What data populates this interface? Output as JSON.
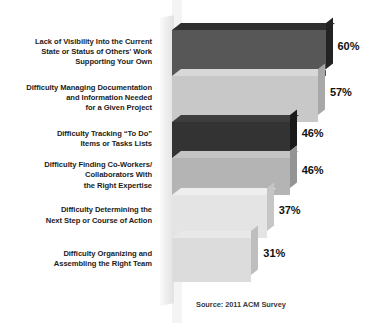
{
  "chart_data": {
    "type": "bar",
    "orientation": "horizontal",
    "title": "",
    "subtitle": "",
    "xlabel": "",
    "ylabel": "",
    "xlim": [
      0,
      60
    ],
    "grid": false,
    "legend": "none",
    "value_suffix": "%",
    "source": "Source: 2011 ACM Survey",
    "categories": [
      "Lack of Visibility Into the Current State or Status of Others' Work Supporting Your Own",
      "Difficulty Managing Documentation and Information Needed for a Given Project",
      "Difficulty Tracking “To Do” Items or Tasks Lists",
      "Difficulty Finding Co-Workers/ Collaborators With the Right Expertise",
      "Difficulty Determining the Next Step or Course of Action",
      "Difficulty Organizing and Assembling the Right Team"
    ],
    "values": [
      60,
      57,
      46,
      46,
      37,
      31
    ],
    "value_labels": [
      "60%",
      "57%",
      "46%",
      "46%",
      "37%",
      "31%"
    ],
    "bar_colors": [
      "#575757",
      "#c8c8c8",
      "#333333",
      "#b4b4b4",
      "#e4e4e4",
      "#dcdcdc"
    ],
    "bars": [
      {
        "label_lines": [
          "Lack of Visibility Into the Current",
          "State or Status of Others' Work",
          "Supporting Your Own"
        ],
        "value": 60,
        "value_label": "60%",
        "color": "#575757",
        "top_color": "#2f2f2f",
        "side_color": "#232323"
      },
      {
        "label_lines": [
          "Difficulty Managing Documentation",
          "and Information Needed",
          "for a Given Project"
        ],
        "value": 57,
        "value_label": "57%",
        "color": "#c8c8c8",
        "top_color": "#d8d8d8",
        "side_color": "#a8a8a8"
      },
      {
        "label_lines": [
          "Difficulty Tracking “To Do”",
          "Items or Tasks Lists"
        ],
        "value": 46,
        "value_label": "46%",
        "color": "#333333",
        "top_color": "#3d3d3d",
        "side_color": "#1a1a1a"
      },
      {
        "label_lines": [
          "Difficulty Finding Co-Workers/",
          "Collaborators With",
          "the Right Expertise"
        ],
        "value": 46,
        "value_label": "46%",
        "color": "#b4b4b4",
        "top_color": "#c4c4c4",
        "side_color": "#949494"
      },
      {
        "label_lines": [
          "Difficulty Determining the",
          "Next Step or Course of Action"
        ],
        "value": 37,
        "value_label": "37%",
        "color": "#e4e4e4",
        "top_color": "#eeeeee",
        "side_color": "#c6c6c6"
      },
      {
        "label_lines": [
          "Difficulty Organizing and",
          "Assembling the Right Team"
        ],
        "value": 31,
        "value_label": "31%",
        "color": "#dcdcdc",
        "top_color": "#e8e8e8",
        "side_color": "#bebebe"
      }
    ]
  }
}
